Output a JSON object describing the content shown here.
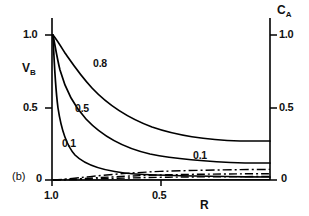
{
  "figure": {
    "panel_label": "(b)",
    "axes": {
      "left": {
        "title": "V",
        "title_sub": "B",
        "ticks": [
          "1.0",
          "0.5",
          "0"
        ],
        "tick_values": [
          1.0,
          0.5,
          0.0
        ],
        "range": [
          0,
          1.0
        ]
      },
      "right": {
        "title": "C",
        "title_sub": "A",
        "ticks": [
          "1.0",
          "0.5",
          "0"
        ],
        "tick_values": [
          1.0,
          0.5,
          0.0
        ],
        "range": [
          0,
          1.0
        ]
      },
      "bottom": {
        "title": "R",
        "ticks": [
          "1.0",
          "0.5"
        ],
        "tick_values": [
          1.0,
          0.5
        ],
        "range": [
          1.0,
          0.0
        ]
      }
    },
    "curve_labels": [
      {
        "text": "0.8",
        "x": 93,
        "y": 58
      },
      {
        "text": "0.5",
        "x": 75,
        "y": 103
      },
      {
        "text": "0.1",
        "x": 62,
        "y": 138
      },
      {
        "text": "0.1",
        "x": 193,
        "y": 150
      }
    ]
  },
  "chart_data": {
    "type": "line",
    "title": "",
    "xlabel": "R",
    "ylabel": "V_B",
    "y2label": "C_A",
    "xlim": [
      1.0,
      0.0
    ],
    "ylim": [
      0.0,
      1.0
    ],
    "y2lim": [
      0.0,
      1.0
    ],
    "grid": false,
    "legend": "inline-curve-labels",
    "x": [
      1.0,
      0.97,
      0.94,
      0.9,
      0.85,
      0.8,
      0.75,
      0.7,
      0.65,
      0.6,
      0.5,
      0.4,
      0.3,
      0.2,
      0.1,
      0.0
    ],
    "series": [
      {
        "name": "0.8",
        "label": "0.8",
        "style": "solid",
        "values": [
          1.0,
          0.96,
          0.925,
          0.885,
          0.845,
          0.812,
          0.784,
          0.76,
          0.74,
          0.722,
          0.693,
          0.672,
          0.657,
          0.646,
          0.638,
          0.632
        ]
      },
      {
        "name": "0.5",
        "label": "0.5",
        "style": "solid",
        "values": [
          1.0,
          0.88,
          0.79,
          0.695,
          0.605,
          0.535,
          0.478,
          0.432,
          0.395,
          0.365,
          0.32,
          0.295,
          0.28,
          0.272,
          0.268,
          0.266
        ]
      },
      {
        "name": "0.1",
        "label": "0.1",
        "style": "solid",
        "values": [
          1.0,
          0.58,
          0.37,
          0.23,
          0.15,
          0.108,
          0.084,
          0.07,
          0.061,
          0.055,
          0.047,
          0.043,
          0.041,
          0.04,
          0.039,
          0.038
        ]
      },
      {
        "name": "0.1-dashdot-upper",
        "label": "0.1",
        "style": "dash-dot",
        "values": [
          0.0,
          0.006,
          0.012,
          0.02,
          0.029,
          0.038,
          0.045,
          0.052,
          0.058,
          0.063,
          0.072,
          0.079,
          0.084,
          0.087,
          0.089,
          0.09
        ]
      },
      {
        "name": "0.1-dashdot-middle",
        "label": "",
        "style": "dash-dot",
        "values": [
          0.0,
          0.004,
          0.008,
          0.013,
          0.019,
          0.025,
          0.03,
          0.035,
          0.039,
          0.043,
          0.049,
          0.054,
          0.057,
          0.059,
          0.06,
          0.061
        ]
      },
      {
        "name": "0.1-dashdot-lower",
        "label": "",
        "style": "dash-dot",
        "values": [
          0.0,
          0.002,
          0.004,
          0.007,
          0.01,
          0.013,
          0.016,
          0.018,
          0.021,
          0.023,
          0.027,
          0.03,
          0.032,
          0.033,
          0.034,
          0.034
        ]
      }
    ]
  }
}
